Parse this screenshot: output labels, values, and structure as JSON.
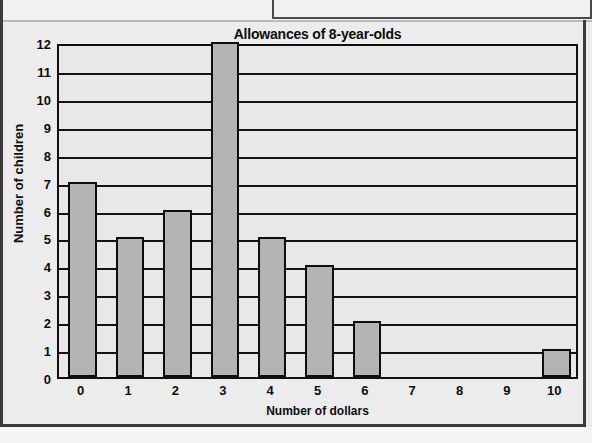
{
  "chart_data": {
    "type": "bar",
    "title": "Allowances of 8-year-olds",
    "xlabel": "Number of dollars",
    "ylabel": "Number of children",
    "categories": [
      "0",
      "1",
      "2",
      "3",
      "4",
      "5",
      "6",
      "7",
      "8",
      "9",
      "10"
    ],
    "values": [
      7,
      5,
      6,
      12,
      5,
      4,
      2,
      0,
      0,
      0,
      1
    ],
    "ylim": [
      0,
      12
    ],
    "yticks": [
      "0",
      "1",
      "2",
      "3",
      "4",
      "5",
      "6",
      "7",
      "8",
      "9",
      "10",
      "11",
      "12"
    ],
    "xticks": [
      "0",
      "1",
      "2",
      "3",
      "4",
      "5",
      "6",
      "7",
      "8",
      "9",
      "10"
    ],
    "grid": "horizontal",
    "legend": "none",
    "colors": {
      "bar_fill": "#b4b4b4",
      "bar_border": "#0d0d0d",
      "plot_background": "#e8e8e8",
      "gridline": "#131313",
      "page_background": "#ececec",
      "text": "#0d0d0d"
    }
  }
}
